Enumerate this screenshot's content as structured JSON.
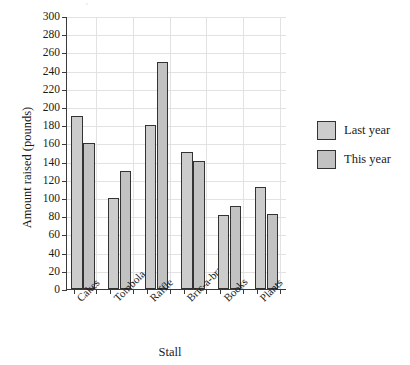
{
  "chart_data": {
    "type": "bar",
    "title": "",
    "xlabel": "Stall",
    "ylabel": "Amount raised (pounds)",
    "categories": [
      "Cakes",
      "Tombola",
      "Raffle",
      "Bric-a-brac",
      "Books",
      "Plants"
    ],
    "series": [
      {
        "name": "Last year",
        "values": [
          190,
          100,
          180,
          151,
          81,
          112
        ],
        "color": "#cccccc"
      },
      {
        "name": "This year",
        "values": [
          160,
          130,
          250,
          141,
          91,
          82
        ],
        "color": "#c2c2c2"
      }
    ],
    "ylim": [
      0,
      300
    ],
    "ytick_step": 20,
    "yticks": [
      0,
      20,
      40,
      60,
      80,
      100,
      120,
      140,
      160,
      180,
      200,
      220,
      240,
      260,
      280,
      300
    ],
    "ytick_labels": [
      "0",
      "20",
      "40",
      "60",
      "80",
      "100",
      "120",
      "140",
      "160",
      "180",
      "200",
      "220",
      "240",
      "260",
      "280",
      "300"
    ],
    "grid": true,
    "grid_color": "#e2e2e2",
    "legend_position": "right",
    "axis_color": "#3a3a3a",
    "bar_edge_color": "#333333",
    "background": "#ffffff"
  },
  "legend": {
    "items": [
      {
        "label": "Last year"
      },
      {
        "label": "This year"
      }
    ]
  },
  "artifact": {
    "top_mark": "'"
  }
}
